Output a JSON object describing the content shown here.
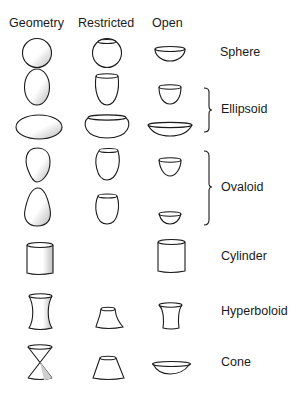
{
  "headers": {
    "geometry": "Geometry",
    "restricted": "Restricted",
    "open": "Open"
  },
  "rows": [
    {
      "label": "Sphere",
      "geometry": "sphere",
      "restricted": "restricted-sphere",
      "open": "open-hemisphere"
    },
    {
      "label": "Ellipsoid",
      "group": "ellipsoid",
      "geometry": "prolate-ellipsoid",
      "restricted": "restricted-prolate",
      "open": "open-prolate"
    },
    {
      "label": "",
      "group": "ellipsoid",
      "geometry": "oblate-ellipsoid",
      "restricted": "restricted-oblate",
      "open": "open-oblate"
    },
    {
      "label": "Ovaloid",
      "group": "ovaloid",
      "geometry": "ovaloid-point-down",
      "restricted": "restricted-ovaloid",
      "open": "open-ovaloid-deep"
    },
    {
      "label": "",
      "group": "ovaloid",
      "geometry": "ovaloid-point-up",
      "restricted": "restricted-ovaloid-2",
      "open": "open-ovaloid-shallow"
    },
    {
      "label": "Cylinder",
      "geometry": "cylinder",
      "restricted": "",
      "open": "open-cylinder"
    },
    {
      "label": "Hyperboloid",
      "geometry": "hyperboloid",
      "restricted": "restricted-hyperboloid",
      "open": "open-hyperboloid"
    },
    {
      "label": "Cone",
      "geometry": "double-cone",
      "restricted": "restricted-cone",
      "open": "open-cone"
    }
  ],
  "labels": {
    "sphere": "Sphere",
    "ellipsoid": "Ellipsoid",
    "ovaloid": "Ovaloid",
    "cylinder": "Cylinder",
    "hyperboloid": "Hyperboloid",
    "cone": "Cone"
  }
}
